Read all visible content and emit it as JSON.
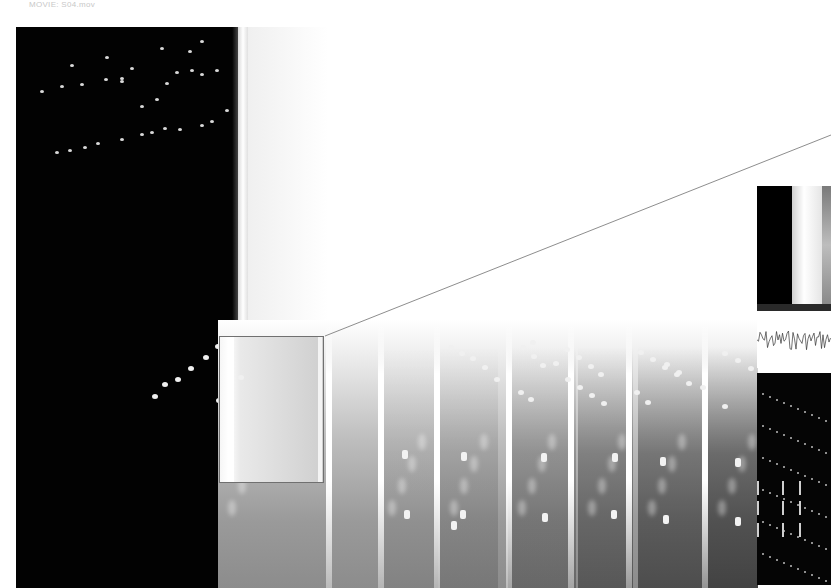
{
  "caption": "MOVIE: S04.mov",
  "views": {
    "main_frame": {
      "label": "main-video-frame"
    },
    "filmstrip": {
      "frame_count": 6
    },
    "zoom_box": {
      "label": "magnified-region"
    },
    "side_panels": [
      {
        "name": "frame-thumbnail"
      },
      {
        "name": "waveform"
      },
      {
        "name": "particle-track"
      }
    ]
  },
  "colors": {
    "background": "#ffffff",
    "frame_dark": "#020202",
    "dot": "#d9d9d9",
    "line": "#707070"
  }
}
